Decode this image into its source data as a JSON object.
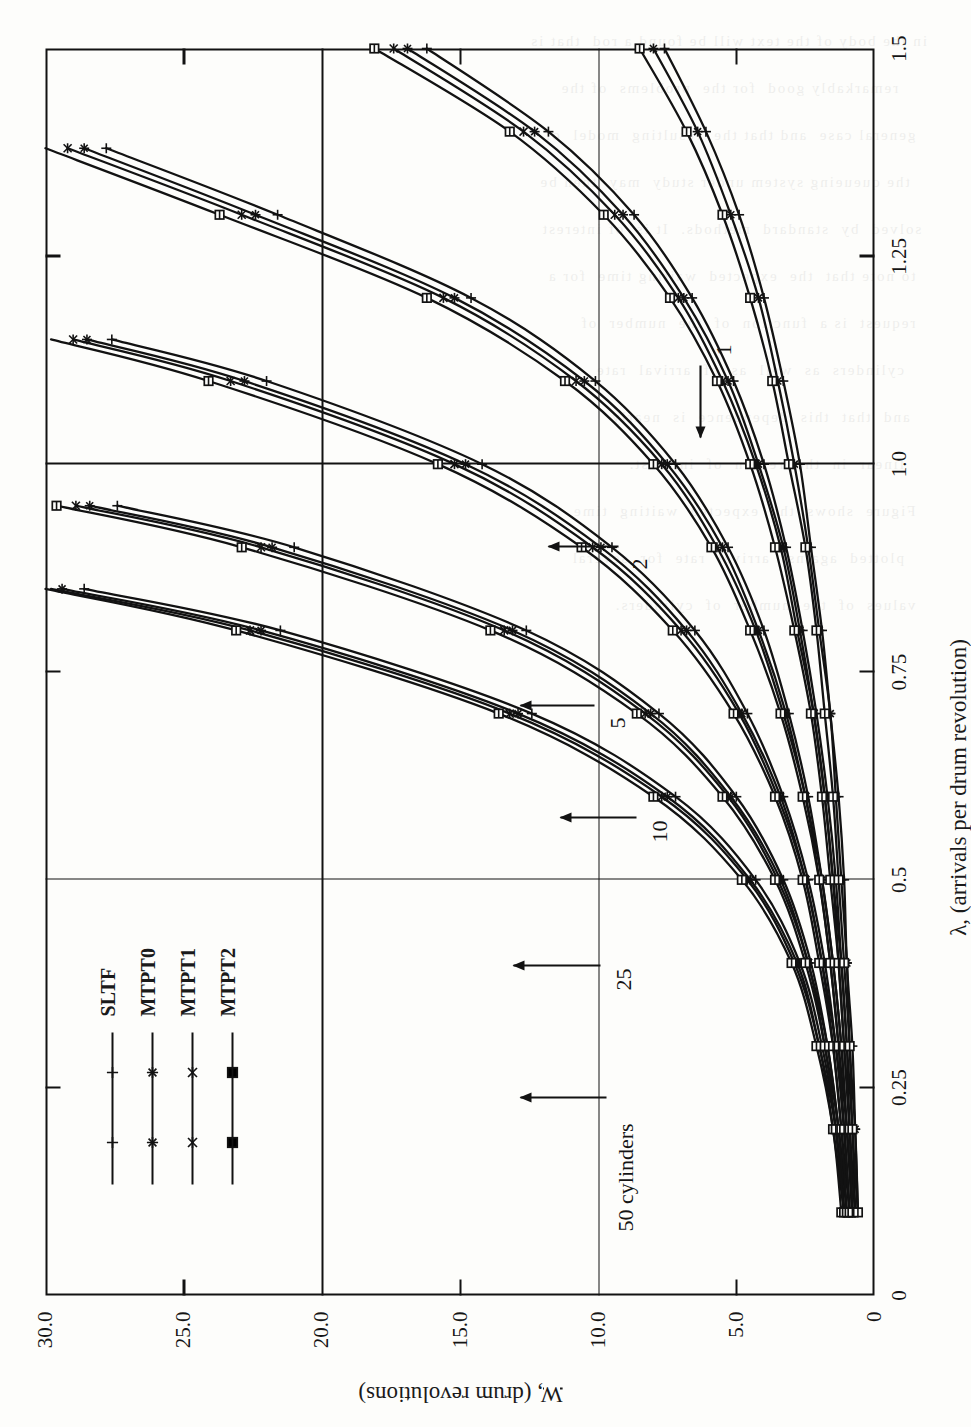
{
  "figure": {
    "kind": "scanned-technical-plot",
    "orientation": "rotated-90-ccw",
    "background_hex": "#fdfdfb",
    "ink_hex": "#121212"
  },
  "axes": {
    "x_title": "λ, (arrivals per drum revolution)",
    "y_title": "W, (drum revolutions)",
    "x_ticks": [
      "0",
      "0.25",
      "0.5",
      "0.75",
      "1.0",
      "1.25",
      "1.5"
    ],
    "y_ticks": [
      "0",
      "5.0",
      "10.0",
      "15.0",
      "20.0",
      "25.0",
      "30.0"
    ]
  },
  "legend": {
    "items": [
      {
        "label": "SLTF",
        "marker": "plus"
      },
      {
        "label": "MTPT0",
        "marker": "asterisk"
      },
      {
        "label": "MTPT1",
        "marker": "x-bar"
      },
      {
        "label": "MTPT2",
        "marker": "square"
      }
    ]
  },
  "annotations": [
    {
      "text": "50 cylinders",
      "arrow": "up"
    },
    {
      "text": "25",
      "arrow": "up"
    },
    {
      "text": "10",
      "arrow": "up"
    },
    {
      "text": "5",
      "arrow": "up"
    },
    {
      "text": "2",
      "arrow": "up"
    },
    {
      "text": "1",
      "arrow": "left"
    }
  ],
  "chart_data": {
    "type": "line",
    "title": "",
    "xlabel": "λ, (arrivals per drum revolution)",
    "ylabel": "W, (drum revolutions)",
    "xlim": [
      0,
      1.5
    ],
    "ylim": [
      0,
      30
    ],
    "xticks": [
      0,
      0.25,
      0.5,
      0.75,
      1.0,
      1.25,
      1.5
    ],
    "yticks": [
      0,
      5,
      10,
      15,
      20,
      25,
      30
    ],
    "grid": true,
    "grid_lines": {
      "x": [
        0.5,
        1.0
      ],
      "y": [
        10,
        20
      ]
    },
    "legend_position": "upper-left",
    "marker_legend": [
      "SLTF",
      "MTPT0",
      "MTPT1",
      "MTPT2"
    ],
    "groups": [
      {
        "label": "50 cylinders",
        "x": [
          0.1,
          0.2,
          0.3,
          0.4,
          0.5,
          0.6,
          0.7,
          0.8,
          0.85
        ],
        "series": [
          {
            "name": "SLTF",
            "values": [
              1.1,
              1.4,
              1.9,
              2.7,
              4.3,
              7.2,
              12.4,
              21.5,
              28.6
            ]
          },
          {
            "name": "MTPT0",
            "values": [
              1.1,
              1.4,
              2.0,
              2.8,
              4.5,
              7.5,
              12.9,
              22.2,
              29.4
            ]
          },
          {
            "name": "MTPT1",
            "values": [
              1.1,
              1.5,
              2.0,
              2.9,
              4.6,
              7.7,
              13.2,
              22.6,
              29.8
            ]
          },
          {
            "name": "MTPT2",
            "values": [
              1.2,
              1.5,
              2.1,
              3.0,
              4.8,
              8.0,
              13.6,
              23.1,
              30.0
            ]
          }
        ]
      },
      {
        "label": "25",
        "x": [
          0.1,
          0.2,
          0.3,
          0.4,
          0.5,
          0.6,
          0.7,
          0.8,
          0.9,
          0.95
        ],
        "series": [
          {
            "name": "SLTF",
            "values": [
              1.0,
              1.3,
              1.7,
              2.3,
              3.3,
              5.0,
              7.8,
              12.6,
              21.0,
              27.4
            ]
          },
          {
            "name": "MTPT0",
            "values": [
              1.0,
              1.3,
              1.7,
              2.4,
              3.4,
              5.2,
              8.1,
              13.1,
              21.8,
              28.4
            ]
          },
          {
            "name": "MTPT1",
            "values": [
              1.1,
              1.3,
              1.8,
              2.4,
              3.5,
              5.3,
              8.3,
              13.4,
              22.2,
              28.9
            ]
          },
          {
            "name": "MTPT2",
            "values": [
              1.1,
              1.4,
              1.8,
              2.5,
              3.6,
              5.5,
              8.6,
              13.9,
              22.9,
              29.6
            ]
          }
        ]
      },
      {
        "label": "10",
        "x": [
          0.1,
          0.2,
          0.3,
          0.4,
          0.5,
          0.6,
          0.7,
          0.8,
          0.9,
          1.0,
          1.1,
          1.15
        ],
        "series": [
          {
            "name": "SLTF",
            "values": [
              0.9,
              1.1,
              1.4,
              1.8,
              2.4,
              3.3,
              4.6,
              6.5,
              9.5,
              14.2,
              22.0,
              27.6
            ]
          },
          {
            "name": "MTPT0",
            "values": [
              0.9,
              1.1,
              1.4,
              1.9,
              2.5,
              3.4,
              4.8,
              6.8,
              9.9,
              14.8,
              22.8,
              28.5
            ]
          },
          {
            "name": "MTPT1",
            "values": [
              0.9,
              1.2,
              1.5,
              1.9,
              2.5,
              3.5,
              4.9,
              7.0,
              10.2,
              15.2,
              23.3,
              29.0
            ]
          },
          {
            "name": "MTPT2",
            "values": [
              1.0,
              1.2,
              1.5,
              2.0,
              2.6,
              3.6,
              5.1,
              7.3,
              10.6,
              15.8,
              24.1,
              29.8
            ]
          }
        ]
      },
      {
        "label": "5",
        "x": [
          0.1,
          0.2,
          0.3,
          0.4,
          0.5,
          0.6,
          0.7,
          0.8,
          0.9,
          1.0,
          1.1,
          1.2,
          1.3,
          1.38
        ],
        "series": [
          {
            "name": "SLTF",
            "values": [
              0.8,
              1.0,
              1.2,
              1.5,
              1.9,
              2.4,
              3.1,
              4.0,
              5.3,
              7.2,
              10.1,
              14.6,
              21.6,
              27.8
            ]
          },
          {
            "name": "MTPT0",
            "values": [
              0.8,
              1.0,
              1.2,
              1.5,
              1.9,
              2.5,
              3.2,
              4.2,
              5.5,
              7.5,
              10.5,
              15.2,
              22.4,
              28.6
            ]
          },
          {
            "name": "MTPT1",
            "values": [
              0.8,
              1.0,
              1.3,
              1.6,
              2.0,
              2.5,
              3.3,
              4.3,
              5.7,
              7.7,
              10.8,
              15.6,
              22.9,
              29.2
            ]
          },
          {
            "name": "MTPT2",
            "values": [
              0.9,
              1.1,
              1.3,
              1.6,
              2.0,
              2.6,
              3.4,
              4.5,
              5.9,
              8.0,
              11.2,
              16.2,
              23.7,
              30.0
            ]
          }
        ]
      },
      {
        "label": "2",
        "x": [
          0.1,
          0.2,
          0.3,
          0.4,
          0.5,
          0.6,
          0.7,
          0.8,
          0.9,
          1.0,
          1.1,
          1.2,
          1.3,
          1.4,
          1.5
        ],
        "series": [
          {
            "name": "SLTF",
            "values": [
              0.7,
              0.8,
              1.0,
              1.2,
              1.4,
              1.7,
              2.1,
              2.6,
              3.2,
              4.0,
              5.1,
              6.6,
              8.7,
              11.8,
              16.2
            ]
          },
          {
            "name": "MTPT0",
            "values": [
              0.7,
              0.9,
              1.0,
              1.2,
              1.5,
              1.8,
              2.2,
              2.7,
              3.3,
              4.2,
              5.3,
              6.9,
              9.1,
              12.3,
              16.9
            ]
          },
          {
            "name": "MTPT1",
            "values": [
              0.7,
              0.9,
              1.1,
              1.3,
              1.5,
              1.8,
              2.2,
              2.8,
              3.4,
              4.3,
              5.5,
              7.1,
              9.4,
              12.7,
              17.4
            ]
          },
          {
            "name": "MTPT2",
            "values": [
              0.8,
              0.9,
              1.1,
              1.3,
              1.6,
              1.9,
              2.3,
              2.9,
              3.6,
              4.5,
              5.7,
              7.4,
              9.8,
              13.2,
              18.1
            ]
          }
        ]
      },
      {
        "label": "1",
        "x": [
          0.1,
          0.2,
          0.3,
          0.4,
          0.5,
          0.6,
          0.7,
          0.8,
          0.9,
          1.0,
          1.1,
          1.2,
          1.3,
          1.4,
          1.5
        ],
        "series": [
          {
            "name": "SLTF",
            "values": [
              0.6,
              0.7,
              0.8,
              1.0,
              1.1,
              1.3,
              1.6,
              1.9,
              2.3,
              2.7,
              3.3,
              4.0,
              4.9,
              6.1,
              7.6
            ]
          },
          {
            "name": "MTPT0",
            "values": [
              0.6,
              0.7,
              0.9,
              1.0,
              1.2,
              1.4,
              1.6,
              2.0,
              2.4,
              2.9,
              3.5,
              4.2,
              5.2,
              6.4,
              8.0
            ]
          },
          {
            "name": "MTPT2",
            "values": [
              0.6,
              0.8,
              0.9,
              1.1,
              1.3,
              1.5,
              1.8,
              2.1,
              2.5,
              3.1,
              3.7,
              4.5,
              5.5,
              6.8,
              8.5
            ]
          }
        ]
      }
    ]
  },
  "ghost_text": "in the body of the text will be found a rod  that is\n     remarkably good  for the  problems  of the\n  general case  and that the  resulting  model  of\n   the queueing system under study  may  then be\n solved  by  standard  methods.  It is  of interest\n  to note that  the  expected  waiting time  for a\n  request  is a  function  of  the  number  of\n    cylinders  as  well  as  of  arrival  rate\n   and  that  this  dependence  is  nearly\n    linear  in  the  region  of  interest.\n  Figure  shows  the  expected  waiting  time\n    plotted  against  arrival  rate  for  several\n  values  of  the  number  of  cylinders."
}
